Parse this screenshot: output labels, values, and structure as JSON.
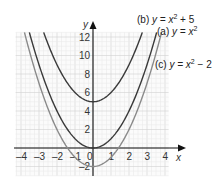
{
  "chart_data": {
    "type": "line",
    "title": "",
    "xlabel": "x",
    "ylabel": "y",
    "xlim": [
      -4.3,
      4.2
    ],
    "ylim": [
      -3,
      12.5
    ],
    "grid": true,
    "x_ticks": [
      "-4",
      "-3",
      "-2",
      "-1",
      "0",
      "1",
      "2",
      "3",
      "4"
    ],
    "y_ticks": [
      "-2",
      "2",
      "4",
      "6",
      "8",
      "10",
      "12"
    ],
    "series": [
      {
        "name": "(a) y = x²",
        "label_prefix": "(a) ",
        "label_eq": "y = x",
        "label_sup": "2",
        "label_suffix": "",
        "expression": "x^2",
        "offset": 0,
        "color": "#3a3a3a",
        "x": [
          -3.5,
          -3,
          -2,
          -1,
          0,
          1,
          2,
          3,
          3.5
        ],
        "values": [
          12.25,
          9,
          4,
          1,
          0,
          1,
          4,
          9,
          12.25
        ]
      },
      {
        "name": "(b) y = x² + 5",
        "label_prefix": "(b) ",
        "label_eq": "y = x",
        "label_sup": "2",
        "label_suffix": " + 5",
        "expression": "x^2 + 5",
        "offset": 5,
        "color": "#3a3a3a",
        "x": [
          -2.6,
          -2,
          -1,
          0,
          1,
          2,
          2.6
        ],
        "values": [
          11.76,
          9,
          6,
          5,
          6,
          9,
          11.76
        ]
      },
      {
        "name": "(c) y = x² − 2",
        "label_prefix": "(c) ",
        "label_eq": "y = x",
        "label_sup": "2",
        "label_suffix": " − 2",
        "expression": "x^2 - 2",
        "offset": -2,
        "color": "#8a8a8a",
        "x": [
          -3.8,
          -3,
          -2,
          -1,
          0,
          1,
          2,
          3,
          3.6
        ],
        "values": [
          12.44,
          7,
          2,
          -1,
          -2,
          -1,
          2,
          7,
          10.96
        ]
      }
    ]
  }
}
